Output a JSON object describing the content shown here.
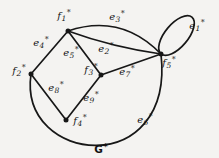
{
  "figure": {
    "caption": {
      "base": "G",
      "sup": "*"
    },
    "ink_color": "#171717",
    "background_color": "#f4f3f1"
  },
  "graph": {
    "vertices": [
      {
        "id": "f1",
        "label": {
          "base": "f",
          "sub": "1",
          "sup": "*"
        }
      },
      {
        "id": "f2",
        "label": {
          "base": "f",
          "sub": "2",
          "sup": "*"
        }
      },
      {
        "id": "f3",
        "label": {
          "base": "f",
          "sub": "3",
          "sup": "*"
        }
      },
      {
        "id": "f4",
        "label": {
          "base": "f",
          "sub": "4",
          "sup": "*"
        }
      },
      {
        "id": "f5",
        "label": {
          "base": "f",
          "sub": "5",
          "sup": "*"
        }
      }
    ],
    "edges": [
      {
        "id": "e1",
        "from": "f5",
        "to": "f5",
        "shape": "self-loop-upper-right",
        "label": {
          "base": "e",
          "sub": "1",
          "sup": "*"
        }
      },
      {
        "id": "e2",
        "from": "f1",
        "to": "f5",
        "shape": "slight-sag-curve",
        "label": {
          "base": "e",
          "sub": "2",
          "sup": "*"
        }
      },
      {
        "id": "e3",
        "from": "f1",
        "to": "f5",
        "shape": "arc-above",
        "label": {
          "base": "e",
          "sub": "3",
          "sup": "*"
        }
      },
      {
        "id": "e4",
        "from": "f1",
        "to": "f2",
        "shape": "straight",
        "label": {
          "base": "e",
          "sub": "4",
          "sup": "*"
        }
      },
      {
        "id": "e5",
        "from": "f1",
        "to": "f3",
        "shape": "straight",
        "label": {
          "base": "e",
          "sub": "5",
          "sup": "*"
        }
      },
      {
        "id": "e6",
        "from": "f2",
        "to": "f5",
        "shape": "large-arc-below",
        "label": {
          "base": "e",
          "sub": "6",
          "sup": "*"
        }
      },
      {
        "id": "e7",
        "from": "f3",
        "to": "f5",
        "shape": "straight",
        "label": {
          "base": "e",
          "sub": "7",
          "sup": "*"
        }
      },
      {
        "id": "e8",
        "from": "f2",
        "to": "f4",
        "shape": "straight",
        "label": {
          "base": "e",
          "sub": "8",
          "sup": "*"
        }
      },
      {
        "id": "e9",
        "from": "f3",
        "to": "f4",
        "shape": "straight",
        "label": {
          "base": "e",
          "sub": "9",
          "sup": "*"
        }
      }
    ]
  }
}
